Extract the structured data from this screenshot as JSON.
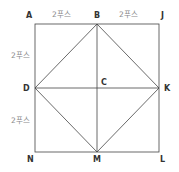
{
  "diagram": {
    "colors": {
      "line": "#444444",
      "label": "#333333",
      "dimension": "#8a8a8a"
    },
    "points": {
      "A": "A",
      "B": "B",
      "J": "J",
      "D": "D",
      "C": "C",
      "K": "K",
      "N": "N",
      "M": "M",
      "L": "L"
    },
    "dimensions": {
      "top_left": "2푸스",
      "top_right": "2푸스",
      "left_upper": "2푸스",
      "left_lower": "2푸스"
    }
  }
}
